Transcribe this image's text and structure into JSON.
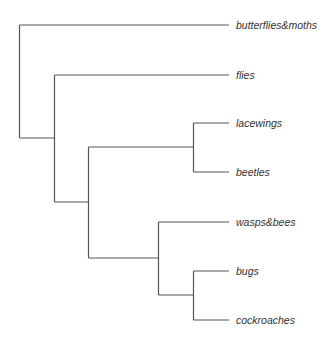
{
  "diagram": {
    "type": "phylogenetic-tree",
    "line_color": "#555555",
    "text_color": "#333333",
    "leaves": [
      {
        "label": "butterflies&moths",
        "y": 25
      },
      {
        "label": "flies",
        "y": 75
      },
      {
        "label": "lacewings",
        "y": 123
      },
      {
        "label": "beetles",
        "y": 172
      },
      {
        "label": "wasps&bees",
        "y": 222
      },
      {
        "label": "bugs",
        "y": 271
      },
      {
        "label": "cockroaches",
        "y": 320
      }
    ],
    "tree_structure": "(butterflies&moths,(flies,((lacewings,beetles),(wasps&bees,(bugs,cockroaches)))))"
  }
}
